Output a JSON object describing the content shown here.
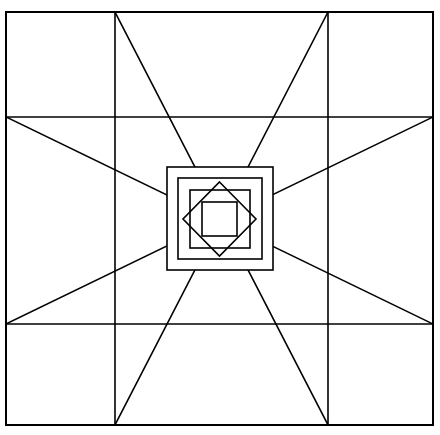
{
  "figure": {
    "background_color": "#ffffff",
    "line_color": "#000000",
    "fill_color": "#ffffff"
  },
  "canvas": {
    "width": 440,
    "height": 435
  },
  "geometry": {
    "outer_square": {
      "name": "outer-border-square",
      "left": 6,
      "top": 12,
      "right": 433,
      "bottom": 425,
      "stroke_width": 2.0
    },
    "grid": {
      "name": "three-by-three-grid",
      "vertical_x": [
        115,
        328
      ],
      "horizontal_y": [
        117,
        324
      ],
      "stroke_width": 1.6
    },
    "center_point": {
      "x": 219.5,
      "y": 218.5
    },
    "star_diagonals": {
      "name": "diagonal-star-rays",
      "stroke_width": 1.6,
      "segments": [
        {
          "name": "main-diagonal-tl-br",
          "x1": 115,
          "y1": 12,
          "x2": 328,
          "y2": 425
        },
        {
          "name": "main-diagonal-tr-bl",
          "x1": 328,
          "y1": 12,
          "x2": 115,
          "y2": 425
        },
        {
          "name": "side-diagonal-lt-rb",
          "x1": 6,
          "y1": 117,
          "x2": 433,
          "y2": 324
        },
        {
          "name": "side-diagonal-lb-rt",
          "x1": 6,
          "y1": 324,
          "x2": 433,
          "y2": 117
        }
      ]
    },
    "medallion": {
      "name": "center-medallion",
      "outer_band_square": {
        "left": 167,
        "top": 167,
        "right": 273,
        "bottom": 270,
        "stroke_width": 1.6
      },
      "inner_band_square": {
        "left": 178,
        "top": 178,
        "right": 262,
        "bottom": 259,
        "stroke_width": 1.6
      },
      "band_square": {
        "left": 190,
        "top": 190,
        "right": 250,
        "bottom": 248,
        "stroke_width": 1.6
      },
      "diamond": {
        "name": "rotated-diamond",
        "points": [
          [
            219.5,
            182
          ],
          [
            256,
            219
          ],
          [
            219.5,
            256
          ],
          [
            183,
            219
          ]
        ],
        "stroke_width": 1.6
      },
      "innermost_square": {
        "left": 202,
        "top": 202,
        "right": 237,
        "bottom": 236,
        "stroke_width": 1.6
      }
    }
  },
  "labels": {
    "figure_caption": "",
    "alt_text": "Black and white geometric quilt block pattern"
  }
}
